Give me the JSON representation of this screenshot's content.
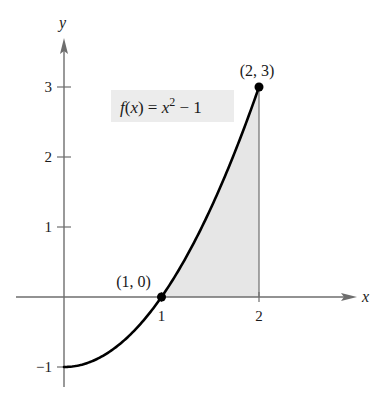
{
  "chart_data": {
    "type": "line",
    "title": "",
    "xlabel": "x",
    "ylabel": "y",
    "xlim": [
      -0.5,
      3.0
    ],
    "ylim": [
      -1.3,
      3.7
    ],
    "grid": false,
    "x_ticks": [
      {
        "value": 1,
        "label": "1"
      },
      {
        "value": 2,
        "label": "2"
      }
    ],
    "y_ticks": [
      {
        "value": -1,
        "label": "−1"
      },
      {
        "value": 1,
        "label": "1"
      },
      {
        "value": 2,
        "label": "2"
      },
      {
        "value": 3,
        "label": "3"
      }
    ],
    "series": [
      {
        "name": "f(x) = x^2 - 1",
        "function": "x^2 - 1",
        "domain": [
          0,
          2
        ],
        "color": "#000000"
      }
    ],
    "shaded_region": {
      "description": "area under f between x=1 and x=2, above x-axis",
      "x_from": 1,
      "x_to": 2,
      "color": "#e6e6e6"
    },
    "points": [
      {
        "x": 1,
        "y": 0,
        "label": "(1, 0)"
      },
      {
        "x": 2,
        "y": 3,
        "label": "(2, 3)"
      }
    ],
    "function_label": {
      "prefix": "f(x) = x",
      "exponent": "2",
      "suffix": " − 1",
      "box_color": "#ececec"
    },
    "axis_color": "#6e6e6e"
  }
}
